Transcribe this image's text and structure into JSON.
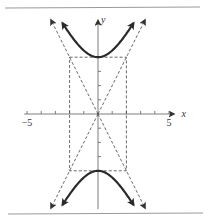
{
  "chart_data": {
    "type": "line",
    "title": "",
    "equation": {
      "form": "vertical-hyperbola",
      "a": 4,
      "b": 2,
      "center": [
        0,
        0
      ]
    },
    "xlabel": "x",
    "ylabel": "y",
    "xlim": [
      -5.2,
      5.6
    ],
    "ylim": [
      -6.7,
      6.7
    ],
    "x_ticks": [
      -5,
      -4,
      -3,
      -2,
      -1,
      1,
      2,
      3,
      4,
      5
    ],
    "x_tick_labels": [
      {
        "value": -5,
        "label": "−5"
      },
      {
        "value": 5,
        "label": "5"
      }
    ],
    "y_ticks": [
      -3,
      -2,
      -1,
      1,
      2,
      3
    ],
    "vertices": [
      [
        0,
        4
      ],
      [
        0,
        -4
      ]
    ],
    "rectangle": {
      "x": [
        -2,
        2
      ],
      "y": [
        -4,
        4
      ],
      "style": "dashed"
    },
    "asymptotes": [
      {
        "slope": 2,
        "label": "y = 2x"
      },
      {
        "slope": -2,
        "label": "y = -2x"
      }
    ],
    "series": [
      {
        "name": "upper-branch",
        "x_range": [
          -2.5,
          2.5
        ],
        "style": "solid-arrows"
      },
      {
        "name": "lower-branch",
        "x_range": [
          -2.5,
          2.5
        ],
        "style": "solid-arrows"
      },
      {
        "name": "asymptote-positive",
        "x_range": [
          -3.3,
          3.3
        ],
        "style": "dashed-arrows"
      },
      {
        "name": "asymptote-negative",
        "x_range": [
          -3.3,
          3.3
        ],
        "style": "dashed-arrows"
      }
    ],
    "grid": false,
    "legend": "none"
  }
}
